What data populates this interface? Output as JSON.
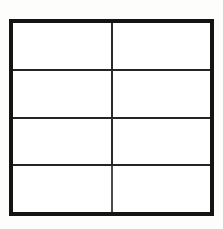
{
  "figure": {
    "type": "grid-table",
    "title": "",
    "caption": "",
    "rows": 4,
    "columns": 2,
    "background_color": "#fdfdfc",
    "cell_fill_color": "#ffffff",
    "outer_border_color": "#141414",
    "outer_border_width_px": 4,
    "inner_line_color": "#2a2a2a",
    "inner_line_width_px": 2,
    "table": {
      "column_headers": [
        "",
        ""
      ],
      "row_labels": [
        "",
        "",
        "",
        ""
      ],
      "cells": [
        [
          "",
          ""
        ],
        [
          "",
          ""
        ],
        [
          "",
          ""
        ],
        [
          "",
          ""
        ]
      ]
    }
  }
}
